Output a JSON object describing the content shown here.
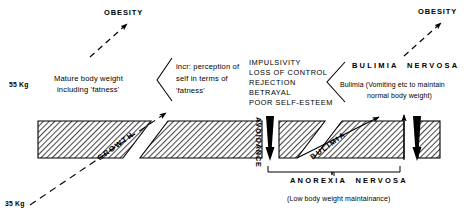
{
  "diagram": {
    "axis": {
      "upper_weight": "55 Kg",
      "lower_weight": "35 Kg"
    },
    "outcomes": {
      "obesity_left": "OBESITY",
      "obesity_right": "OBESITY"
    },
    "nodes": {
      "mature_weight_line1": "Mature body weight",
      "mature_weight_line2": "including 'fatness'",
      "perception_line1": "incr: perception of",
      "perception_line2": "self in terms of",
      "perception_line3": "'fatness'",
      "bulimia_nervosa_heading": "BULIMIA  NERVOSA",
      "bulimia_detail_line1": "Bulimia (Vomiting etc to maintain",
      "bulimia_detail_line2": "normal body weight)",
      "anorexia_nervosa_heading": "ANOREXIA  NERVOSA",
      "anorexia_detail": "(Low body weight maintainance)"
    },
    "trigger_list": [
      "IMPULSIVITY",
      "LOSS OF CONTROL",
      "REJECTION",
      "BETRAYAL",
      "POOR SELF-ESTEEM"
    ],
    "path_labels": {
      "growth": "GROWTH",
      "avoidance": "AVOIDANCE",
      "bulimia": "BULIMIA"
    },
    "colors": {
      "ink": "#000000",
      "hatch": "#555555",
      "background": "#ffffff"
    }
  }
}
